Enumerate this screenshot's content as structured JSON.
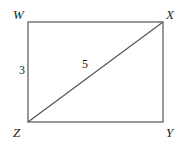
{
  "figure": {
    "background_color": "#ffffff",
    "stroke_color": "#555555",
    "text_color": "#1a1a1a",
    "vertices": {
      "w": "W",
      "x": "X",
      "y": "Y",
      "z": "Z"
    },
    "measurements": {
      "side_wz": "3",
      "diagonal_zx": "5"
    },
    "geometry": {
      "rect": {
        "left": 28,
        "top": 22,
        "right": 163,
        "bottom": 122
      },
      "diagonal": {
        "x1": 28,
        "y1": 122,
        "x2": 163,
        "y2": 22
      }
    }
  }
}
